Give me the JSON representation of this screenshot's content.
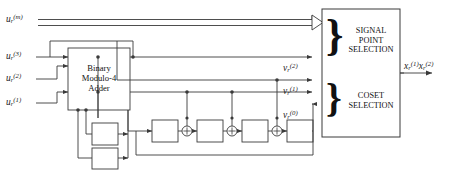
{
  "diagram": {
    "inputs": [
      {
        "id": "u-m",
        "base": "u",
        "sub": "r",
        "sup": "(m)",
        "type": "bus"
      },
      {
        "id": "u-3",
        "base": "u",
        "sub": "r",
        "sup": "(3)",
        "type": "line"
      },
      {
        "id": "u-2",
        "base": "u",
        "sub": "r",
        "sup": "(2)",
        "type": "line"
      },
      {
        "id": "u-1",
        "base": "u",
        "sub": "r",
        "sup": "(1)",
        "type": "line"
      }
    ],
    "adder": {
      "line1": "Binary",
      "line2": "Modulo-4",
      "line3": "Adder"
    },
    "taps": [
      {
        "id": "v-2",
        "base": "v",
        "sub": "r",
        "sup": "(2)"
      },
      {
        "id": "v-1",
        "base": "v",
        "sub": "r",
        "sup": "(1)"
      },
      {
        "id": "v-0",
        "base": "v",
        "sub": "r",
        "sup": "(0)"
      }
    ],
    "selector": {
      "signal_point": {
        "line1": "SIGNAL",
        "line2": "POINT",
        "line3": "SELECTION"
      },
      "coset": {
        "line1": "COSET",
        "line2": "SELECTION"
      },
      "brace_glyph": "}"
    },
    "output": {
      "base1": "x",
      "sub1": "r",
      "sup1": "(1)",
      "base2": "x",
      "sub2": "r",
      "sup2": "(2)"
    },
    "xor_symbol": "+",
    "delay_boxes": {
      "register_count": 4,
      "feedback_count": 2
    },
    "colors": {
      "line": "#3a3a3a",
      "text": "#111111",
      "background": "#ffffff"
    }
  }
}
